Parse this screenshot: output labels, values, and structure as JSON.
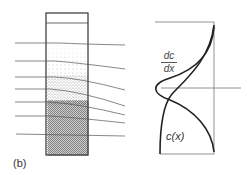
{
  "figure": {
    "caption": "(b)",
    "labels": {
      "derivative_numerator": "dc",
      "derivative_denominator": "dx",
      "concentration": "c(x)"
    },
    "colors": {
      "line": "#222222",
      "thin_line": "#666666",
      "stipple": "#555555"
    }
  }
}
